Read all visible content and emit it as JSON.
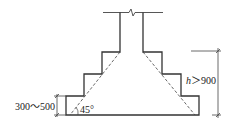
{
  "diagram": {
    "type": "stepped-foundation-section",
    "labels": {
      "angle": "45°",
      "step_height": "300～500",
      "height_var": "h",
      "height_cond": "＞900"
    },
    "colors": {
      "line": "#333333",
      "background": "#ffffff"
    }
  }
}
